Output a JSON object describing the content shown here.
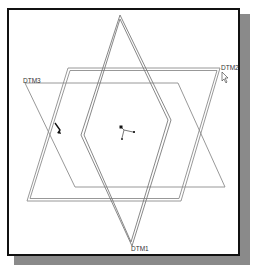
{
  "diagram": {
    "labels": {
      "dtm1": "DTM1",
      "dtm2": "DTM2",
      "dtm3": "DTM3"
    },
    "planes": [
      {
        "name": "DTM1",
        "style": "double",
        "points": [
          [
            120,
            15
          ],
          [
            171,
            120
          ],
          [
            132,
            246
          ],
          [
            81,
            135
          ]
        ]
      },
      {
        "name": "DTM2",
        "style": "double",
        "points": [
          [
            68,
            68
          ],
          [
            220,
            68
          ],
          [
            181,
            201
          ],
          [
            27,
            201
          ]
        ]
      },
      {
        "name": "DTM3",
        "style": "single",
        "points": [
          [
            25,
            83
          ],
          [
            178,
            83
          ],
          [
            225,
            187
          ],
          [
            75,
            187
          ]
        ]
      }
    ],
    "inner_hexagon": [
      [
        143,
        60
      ],
      [
        171,
        120
      ],
      [
        143,
        176
      ],
      [
        108,
        176
      ],
      [
        81,
        135
      ],
      [
        110,
        60
      ]
    ],
    "colors": {
      "line": "#7a7a7a",
      "frame": "#111111",
      "shadow": "#8a8a8a",
      "label": "#333333"
    }
  }
}
